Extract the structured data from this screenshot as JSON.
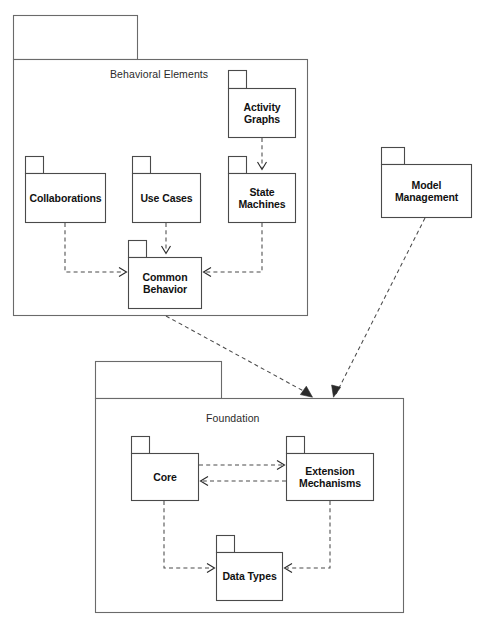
{
  "diagram": {
    "type": "uml-package-diagram",
    "title_visible": false,
    "stroke_color": "#4a4a4a",
    "outer_stroke_color": "#6a6a6a",
    "background": "#ffffff",
    "packages": [
      {
        "id": "behavioral-elements",
        "label": "Behavioral Elements",
        "kind": "outer",
        "label_style": "plain"
      },
      {
        "id": "activity-graphs",
        "label": "Activity\nGraphs",
        "kind": "inner",
        "label_style": "bold"
      },
      {
        "id": "collaborations",
        "label": "Collaborations",
        "kind": "inner",
        "label_style": "bold"
      },
      {
        "id": "use-cases",
        "label": "Use Cases",
        "kind": "inner",
        "label_style": "bold"
      },
      {
        "id": "state-machines",
        "label": "State\nMachines",
        "kind": "inner",
        "label_style": "bold"
      },
      {
        "id": "common-behavior",
        "label": "Common\nBehavior",
        "kind": "inner",
        "label_style": "bold"
      },
      {
        "id": "model-management",
        "label": "Model\nManagement",
        "kind": "standalone",
        "label_style": "bold"
      },
      {
        "id": "foundation",
        "label": "Foundation",
        "kind": "outer",
        "label_style": "plain"
      },
      {
        "id": "core",
        "label": "Core",
        "kind": "inner",
        "label_style": "bold"
      },
      {
        "id": "extension-mechanisms",
        "label": "Extension\nMechanisms",
        "kind": "inner",
        "label_style": "bold"
      },
      {
        "id": "data-types",
        "label": "Data Types",
        "kind": "inner",
        "label_style": "bold"
      }
    ],
    "dependencies": [
      {
        "id": "dep-activity-to-state",
        "from": "activity-graphs",
        "to": "state-machines",
        "style": "dashed-arrow"
      },
      {
        "id": "dep-collaborations-to-common",
        "from": "collaborations",
        "to": "common-behavior",
        "style": "dashed-arrow"
      },
      {
        "id": "dep-usecases-to-common",
        "from": "use-cases",
        "to": "common-behavior",
        "style": "dashed-arrow"
      },
      {
        "id": "dep-statemachines-to-common",
        "from": "state-machines",
        "to": "common-behavior",
        "style": "dashed-arrow"
      },
      {
        "id": "dep-behavioral-to-foundation",
        "from": "behavioral-elements",
        "to": "foundation",
        "style": "dashed-arrow"
      },
      {
        "id": "dep-modelmgmt-to-foundation",
        "from": "model-management",
        "to": "foundation",
        "style": "dashed-arrow"
      },
      {
        "id": "dep-core-to-extension",
        "from": "core",
        "to": "extension-mechanisms",
        "style": "dashed-arrow"
      },
      {
        "id": "dep-extension-to-core",
        "from": "extension-mechanisms",
        "to": "core",
        "style": "dashed-arrow"
      },
      {
        "id": "dep-core-to-datatypes",
        "from": "core",
        "to": "data-types",
        "style": "dashed-arrow"
      },
      {
        "id": "dep-extension-to-datatypes",
        "from": "extension-mechanisms",
        "to": "data-types",
        "style": "dashed-arrow"
      }
    ]
  }
}
